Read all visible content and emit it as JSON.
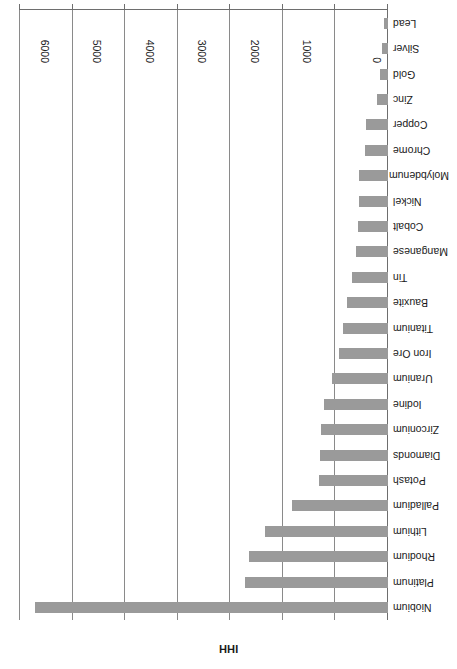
{
  "chart_data": {
    "type": "bar",
    "orientation": "horizontal",
    "title": "",
    "xlabel": "IHH",
    "ylabel": "",
    "xlim": [
      0,
      7000
    ],
    "xticks": [
      0,
      1000,
      2000,
      3000,
      4000,
      5000,
      6000,
      7000
    ],
    "xticklabels": [
      "0",
      "1000",
      "2000",
      "3000",
      "4000",
      "5000",
      "6000",
      "7000"
    ],
    "grid": "vertical",
    "legend": "none",
    "bar_color": "#9a9a9a",
    "rotated_180": true,
    "categories": [
      "Lead",
      "Silver",
      "Gold",
      "Zinc",
      "Copper",
      "Chrome",
      "Molybdenum",
      "Nickel",
      "Cobalt",
      "Manganese",
      "Tin",
      "Bauxite",
      "Titanium",
      "Iron Ore",
      "Uranium",
      "Iodine",
      "Zirconium",
      "Diamonds",
      "Potash",
      "Palladium",
      "Lithium",
      "Rhodium",
      "Platinum",
      "Niobium"
    ],
    "values": [
      76,
      114,
      152,
      215,
      419,
      433,
      552,
      561,
      571,
      610,
      692,
      786,
      851,
      933,
      1067,
      1219,
      1282,
      1295,
      1314,
      1824,
      2333,
      2647,
      2725,
      6706
    ]
  }
}
